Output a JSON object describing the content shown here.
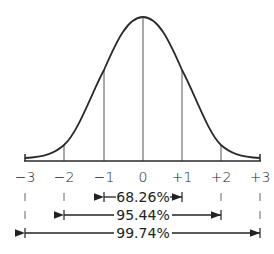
{
  "axis": {
    "ticks": [
      "−3",
      "−2",
      "−1",
      "0",
      "+1",
      "+2",
      "+3"
    ]
  },
  "ranges": [
    {
      "label": "68.26%",
      "from": "−1",
      "to": "+1"
    },
    {
      "label": "95.44%",
      "from": "−2",
      "to": "+2"
    },
    {
      "label": "99.74%",
      "from": "−3",
      "to": "+3"
    }
  ],
  "colors": {
    "curve": "#2a2a2a",
    "lines": "#555555",
    "text": "#222222"
  }
}
